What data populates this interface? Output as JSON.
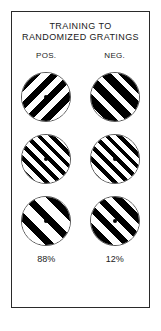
{
  "figure": {
    "title_lines": [
      "TRAINING  TO",
      "RANDOMIZED GRATINGS"
    ],
    "columns": [
      {
        "label": "POS.",
        "percent": "88%"
      },
      {
        "label": "NEG.",
        "percent": "12%"
      }
    ],
    "rows": [
      {
        "row_index": 1,
        "cells": [
          {
            "column": "POS.",
            "orientation": "forward-slash",
            "angle_deg": 45,
            "stripe_period_px": 13,
            "duty_cycle": 0.5,
            "phase_offset_px": 2,
            "fixation_dot": "dark",
            "stripe_color": "#000000",
            "background_color": "#ffffff"
          },
          {
            "column": "NEG.",
            "orientation": "back-slash",
            "angle_deg": 135,
            "stripe_period_px": 14,
            "duty_cycle": 0.6,
            "phase_offset_px": 5,
            "fixation_dot": "none",
            "stripe_color": "#000000",
            "background_color": "#ffffff"
          }
        ]
      },
      {
        "row_index": 2,
        "cells": [
          {
            "column": "POS.",
            "orientation": "back-slash",
            "angle_deg": 135,
            "stripe_period_px": 9,
            "duty_cycle": 0.45,
            "phase_offset_px": 0,
            "fixation_dot": "dark",
            "stripe_color": "#000000",
            "background_color": "#ffffff"
          },
          {
            "column": "NEG.",
            "orientation": "back-slash",
            "angle_deg": 135,
            "stripe_period_px": 9,
            "duty_cycle": 0.45,
            "phase_offset_px": 0,
            "fixation_dot": "dark",
            "stripe_color": "#000000",
            "background_color": "#ffffff"
          }
        ]
      },
      {
        "row_index": 3,
        "cells": [
          {
            "column": "POS.",
            "orientation": "back-slash",
            "angle_deg": 135,
            "stripe_period_px": 17,
            "duty_cycle": 0.45,
            "phase_offset_px": 3,
            "fixation_dot": "dark",
            "stripe_color": "#000000",
            "background_color": "#ffffff"
          },
          {
            "column": "NEG.",
            "orientation": "back-slash",
            "angle_deg": 135,
            "stripe_period_px": 13,
            "duty_cycle": 0.5,
            "phase_offset_px": 6,
            "fixation_dot": "dark",
            "stripe_color": "#000000",
            "background_color": "#ffffff"
          }
        ]
      }
    ]
  },
  "chart_data": {
    "type": "bar",
    "title": "TRAINING  TO RANDOMIZED GRATINGS",
    "categories": [
      "POS.",
      "NEG."
    ],
    "values": [
      88,
      12
    ],
    "value_labels": [
      "88%",
      "12%"
    ],
    "xlabel": "",
    "ylabel": "",
    "ylim": [
      0,
      100
    ],
    "grid": false,
    "legend": "none",
    "annotations": [
      "Each column shows three circular grating stimuli above its response percentage.",
      "POS. column response: 88%",
      "NEG. column response: 12%"
    ]
  }
}
